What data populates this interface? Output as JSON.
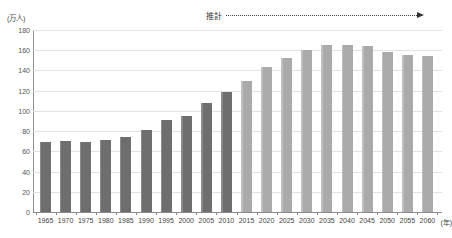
{
  "chart_data": {
    "type": "bar",
    "title": "",
    "subtitle": "",
    "xlabel": "(年)",
    "ylabel": "(万人)",
    "ylim": [
      0,
      180
    ],
    "ytick_labels": [
      "180",
      "160",
      "140",
      "120",
      "100",
      "80",
      "60",
      "40",
      "20",
      "0"
    ],
    "ytick_values": [
      180,
      160,
      140,
      120,
      100,
      80,
      60,
      40,
      20,
      0
    ],
    "grid": true,
    "legend_position": "none",
    "categories": [
      "1965",
      "1970",
      "1975",
      "1980",
      "1985",
      "1990",
      "1995",
      "2000",
      "2005",
      "2010",
      "2015",
      "2020",
      "2025",
      "2030",
      "2035",
      "2040",
      "2045",
      "2050",
      "2055",
      "2060"
    ],
    "values": [
      69,
      70,
      69,
      71,
      74,
      81,
      91,
      95,
      108,
      119,
      130,
      143,
      152,
      160,
      165,
      165,
      164,
      158,
      155,
      154
    ],
    "series": [
      {
        "name": "実績",
        "kinds": [
          "actual",
          "actual",
          "actual",
          "actual",
          "actual",
          "actual",
          "actual",
          "actual",
          "actual",
          "actual",
          "estimate",
          "estimate",
          "estimate",
          "estimate",
          "estimate",
          "estimate",
          "estimate",
          "estimate",
          "estimate",
          "estimate"
        ]
      }
    ],
    "annotations": [
      {
        "name": "estimate-range",
        "label": "推計",
        "from_category": "2015",
        "to_category": "2060",
        "style": "dotted-arrow"
      }
    ],
    "colors": {
      "actual_bar": "#6e6e6e",
      "estimate_bar": "#aaaaaa",
      "gridline": "#e2e2e2",
      "axis": "#8c8c8c",
      "text": "#444444"
    }
  }
}
